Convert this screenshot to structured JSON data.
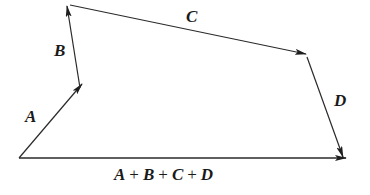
{
  "diagram": {
    "type": "vector-addition-polygon",
    "stroke_color": "#2a2a2a",
    "vectors": [
      {
        "name": "A",
        "label": "A",
        "from": [
          19,
          158
        ],
        "to": [
          82,
          84
        ]
      },
      {
        "name": "B",
        "label": "B",
        "from": [
          80,
          88
        ],
        "to": [
          67,
          6
        ]
      },
      {
        "name": "C",
        "label": "C",
        "from": [
          70,
          5
        ],
        "to": [
          306,
          54
        ]
      },
      {
        "name": "D",
        "label": "D",
        "from": [
          307,
          57
        ],
        "to": [
          343,
          157
        ]
      },
      {
        "name": "resultant",
        "label": "A + B + C + D",
        "from": [
          19,
          158
        ],
        "to": [
          346,
          158
        ]
      }
    ],
    "labels": {
      "A": "A",
      "B": "B",
      "C": "C",
      "D": "D",
      "sum_terms": [
        "A",
        "+",
        "B",
        "+",
        "C",
        "+",
        "D"
      ]
    }
  }
}
